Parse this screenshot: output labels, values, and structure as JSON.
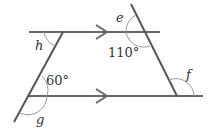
{
  "diagram": {
    "type": "parallel-lines-with-transversals",
    "angles": {
      "e": "e",
      "f": "f",
      "g": "g",
      "h": "h",
      "given_top": "110°",
      "given_bottom": "60°"
    },
    "colors": {
      "line": "#555555",
      "arc": "#999999",
      "text": "#333333"
    }
  }
}
